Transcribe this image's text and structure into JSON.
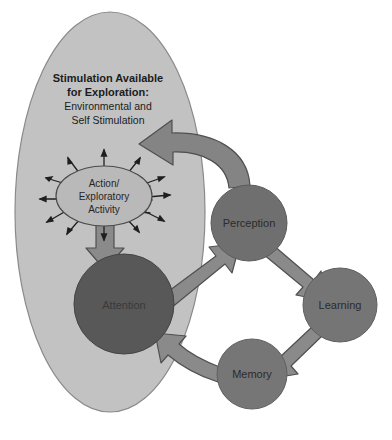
{
  "diagram": {
    "title_block": {
      "name": "stimulation-field-title",
      "lines": [
        {
          "text": "Stimulation Available",
          "weight": "bold"
        },
        {
          "text": "for Exploration:",
          "weight": "bold"
        },
        {
          "text": "Environmental and",
          "weight": "regular"
        },
        {
          "text": "Self Stimulation",
          "weight": "regular"
        }
      ]
    },
    "nodes": [
      {
        "id": "stimulation-field",
        "label": "",
        "shape": "ellipse",
        "cx": 110,
        "cy": 212,
        "rx": 95,
        "ry": 200,
        "fill": "#c2c2c2",
        "stroke": "#7d7d7d"
      },
      {
        "id": "action-exploratory-activity",
        "label_lines": [
          "Action/",
          "Exploratory",
          "Activity"
        ],
        "shape": "ellipse",
        "cx": 104,
        "cy": 196,
        "rx": 48,
        "ry": 30,
        "fill": "#b9b9b9",
        "stroke": "#5f5f5f"
      },
      {
        "id": "attention",
        "label": "Attention",
        "shape": "circle",
        "cx": 124,
        "cy": 304,
        "r": 50,
        "fill": "#585858",
        "stroke": "#3f3f3f"
      },
      {
        "id": "perception",
        "label": "Perception",
        "shape": "circle",
        "cx": 249,
        "cy": 223,
        "r": 38,
        "fill": "#6f6f6f",
        "stroke": "#5a5a5a"
      },
      {
        "id": "learning",
        "label": "Learning",
        "shape": "circle",
        "cx": 340,
        "cy": 305,
        "r": 37,
        "fill": "#757575",
        "stroke": "#5f5f5f"
      },
      {
        "id": "memory",
        "label": "Memory",
        "shape": "circle",
        "cx": 252,
        "cy": 374,
        "r": 35,
        "fill": "#767676",
        "stroke": "#606060"
      }
    ],
    "arrows": [
      {
        "id": "perception-to-action",
        "from": "perception",
        "to": "action-exploratory-activity"
      },
      {
        "id": "action-to-attention",
        "from": "action-exploratory-activity",
        "to": "attention"
      },
      {
        "id": "attention-to-perception",
        "from": "attention",
        "to": "perception"
      },
      {
        "id": "perception-to-learning",
        "from": "perception",
        "to": "learning"
      },
      {
        "id": "learning-to-memory",
        "from": "learning",
        "to": "memory"
      },
      {
        "id": "memory-to-attention",
        "from": "memory",
        "to": "attention"
      }
    ],
    "radiating_arrows": {
      "id": "exploratory-radiating-arrows",
      "count": 12,
      "description": "small arrows radiating outward from Action/Exploratory Activity ellipse"
    },
    "colors": {
      "background": "#ffffff",
      "field_fill": "#c2c2c2",
      "arrow_fill": "#7f7f7f",
      "arrow_stroke": "#4d4d4d",
      "dark_node": "#585858",
      "mid_node": "#6f6f6f"
    }
  }
}
